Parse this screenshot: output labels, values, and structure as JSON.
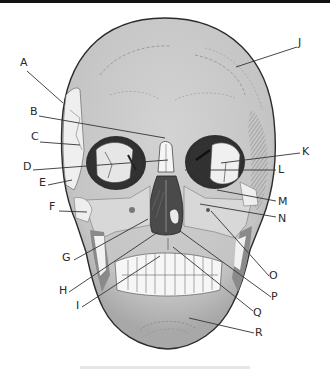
{
  "figure": {
    "colors": {
      "bone": "#c9c9c9",
      "bone_light": "#e4e4e4",
      "bone_white": "#f2f2f2",
      "shadow": "#6e6e6e",
      "outline": "#2b2b2b",
      "leader_line": "#333333",
      "label_text": "#2a2a2a"
    },
    "labels": [
      {
        "id": "A",
        "text": "A",
        "x": 20,
        "y": 62,
        "line": [
          [
            27,
            71
          ],
          [
            63,
            103
          ]
        ]
      },
      {
        "id": "B",
        "text": "B",
        "x": 30,
        "y": 111,
        "line": [
          [
            39,
            116
          ],
          [
            165,
            138
          ]
        ]
      },
      {
        "id": "C",
        "text": "C",
        "x": 31,
        "y": 136,
        "line": [
          [
            40,
            142
          ],
          [
            80,
            145
          ]
        ]
      },
      {
        "id": "D",
        "text": "D",
        "x": 23,
        "y": 166,
        "line": [
          [
            33,
            170
          ],
          [
            168,
            160
          ]
        ]
      },
      {
        "id": "E",
        "text": "E",
        "x": 39,
        "y": 182,
        "line": [
          [
            48,
            185
          ],
          [
            72,
            180
          ]
        ]
      },
      {
        "id": "F",
        "text": "F",
        "x": 49,
        "y": 206,
        "line": [
          [
            59,
            211
          ],
          [
            87,
            212
          ]
        ]
      },
      {
        "id": "G",
        "text": "G",
        "x": 62,
        "y": 257,
        "line": [
          [
            74,
            260
          ],
          [
            148,
            219
          ]
        ]
      },
      {
        "id": "H",
        "text": "H",
        "x": 59,
        "y": 286,
        "line": [
          [
            69,
            292
          ],
          [
            158,
            232
          ]
        ]
      },
      {
        "id": "I",
        "text": "I",
        "x": 76,
        "y": 303,
        "line": [
          [
            82,
            307
          ],
          [
            160,
            256
          ]
        ]
      },
      {
        "id": "J",
        "text": "J",
        "x": 298,
        "y": 40,
        "line": [
          [
            297,
            47
          ],
          [
            236,
            67
          ]
        ]
      },
      {
        "id": "K",
        "text": "K",
        "x": 302,
        "y": 148,
        "line": [
          [
            300,
            153
          ],
          [
            221,
            163
          ]
        ]
      },
      {
        "id": "L",
        "text": "L",
        "x": 278,
        "y": 165,
        "line": [
          [
            276,
            170
          ],
          [
            185,
            170
          ]
        ]
      },
      {
        "id": "M",
        "text": "M",
        "x": 278,
        "y": 199,
        "line": [
          [
            276,
            201
          ],
          [
            217,
            190
          ]
        ]
      },
      {
        "id": "N",
        "text": "N",
        "x": 278,
        "y": 214,
        "line": [
          [
            276,
            217
          ],
          [
            200,
            204
          ]
        ]
      },
      {
        "id": "O",
        "text": "O",
        "x": 270,
        "y": 273,
        "line": [
          [
            269,
            276
          ],
          [
            211,
            211
          ]
        ]
      },
      {
        "id": "P",
        "text": "P",
        "x": 272,
        "y": 294,
        "line": [
          [
            271,
            297
          ],
          [
            180,
            231
          ]
        ]
      },
      {
        "id": "Q",
        "text": "Q",
        "x": 254,
        "y": 310,
        "line": [
          [
            253,
            311
          ],
          [
            173,
            247
          ]
        ]
      },
      {
        "id": "R",
        "text": "R",
        "x": 256,
        "y": 330,
        "line": [
          [
            254,
            333
          ],
          [
            189,
            318
          ]
        ]
      }
    ]
  }
}
